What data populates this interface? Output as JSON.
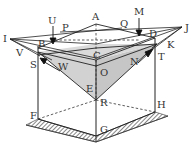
{
  "diagram": {
    "type": "3d-geometry-roof-structure",
    "colors": {
      "stroke": "#2a2a2a",
      "shade": "#cfcfcf",
      "hatch": "#333333",
      "background": "#ffffff"
    },
    "labels": {
      "A": "A",
      "B": "B",
      "C": "C",
      "D": "D",
      "E": "E",
      "F": "F",
      "G": "G",
      "H": "H",
      "I": "I",
      "J": "J",
      "K": "K",
      "M": "M",
      "N": "N",
      "O": "O",
      "P": "P",
      "Q": "Q",
      "R": "R",
      "S": "S",
      "T": "T",
      "U": "U",
      "V": "V",
      "W": "W"
    }
  }
}
